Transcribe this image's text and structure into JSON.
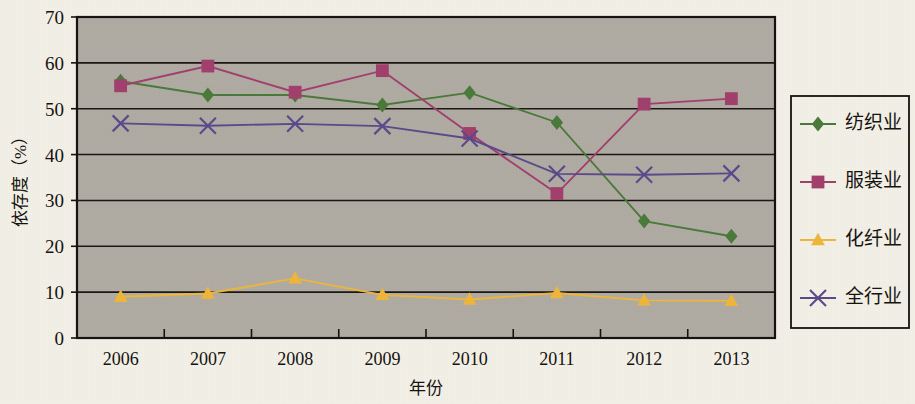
{
  "chart_data": {
    "type": "line",
    "title": "",
    "xlabel": "年份",
    "ylabel": "依存度（%）",
    "categories": [
      "2006",
      "2007",
      "2008",
      "2009",
      "2010",
      "2011",
      "2012",
      "2013"
    ],
    "xlim": [
      2006,
      2013
    ],
    "ylim": [
      0,
      70
    ],
    "ytick_values": [
      "0",
      "10",
      "20",
      "30",
      "40",
      "50",
      "60",
      "70"
    ],
    "ytick_step": 10,
    "grid": "horizontal",
    "legend_position": "right-outside",
    "plot_background": "#b0aca4",
    "page_background": "#f3f0e7",
    "axis_color": "#15120f",
    "series": [
      {
        "name": "纺织业",
        "color": "#4a7a3a",
        "marker": "diamond",
        "values": [
          56.0,
          53.0,
          53.0,
          50.8,
          53.5,
          47.0,
          25.5,
          22.2
        ]
      },
      {
        "name": "服装业",
        "color": "#a33f6d",
        "marker": "square",
        "values": [
          55.0,
          59.3,
          53.6,
          58.3,
          44.6,
          31.5,
          51.0,
          52.2
        ]
      },
      {
        "name": "化纤业",
        "color": "#f0b63a",
        "marker": "triangle",
        "values": [
          9.0,
          9.7,
          13.0,
          9.4,
          8.4,
          9.8,
          8.2,
          8.1
        ]
      },
      {
        "name": "全行业",
        "color": "#5a4a8a",
        "marker": "cross",
        "values": [
          46.8,
          46.3,
          46.7,
          46.2,
          43.5,
          35.8,
          35.6,
          35.9
        ]
      }
    ]
  }
}
